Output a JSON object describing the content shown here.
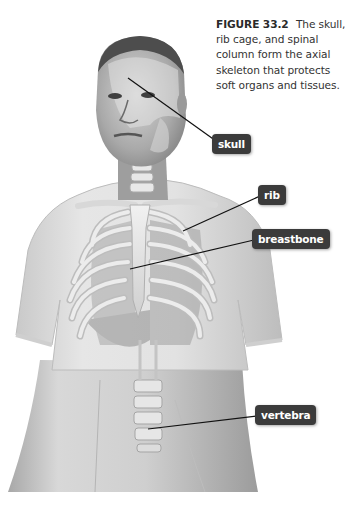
{
  "figure": {
    "number": "FIGURE 33.2",
    "caption": "The skull, rib cage, and spinal column form the axial skeleton that protects soft organs and tissues.",
    "illustration": "Grayscale illustration of a person in a T-shirt with the axial skeleton (skull, rib cage, breastbone, spinal column) overlaid"
  },
  "labels": [
    {
      "id": "skull",
      "text": "skull",
      "box": {
        "x": 212,
        "y": 136
      },
      "points_to": {
        "x": 128,
        "y": 78
      }
    },
    {
      "id": "rib",
      "text": "rib",
      "box": {
        "x": 258,
        "y": 186
      },
      "points_to": {
        "x": 183,
        "y": 231
      }
    },
    {
      "id": "breastbone",
      "text": "breastbone",
      "box": {
        "x": 252,
        "y": 230
      },
      "points_to": {
        "x": 130,
        "y": 269
      }
    },
    {
      "id": "vertebra",
      "text": "vertebra",
      "box": {
        "x": 255,
        "y": 406
      },
      "points_to": {
        "x": 148,
        "y": 429
      }
    }
  ],
  "colors": {
    "background": "#ffffff",
    "label_bg": "#3b3b3b",
    "label_text": "#ffffff",
    "caption_text": "#333333",
    "leader_line": "#111111"
  }
}
